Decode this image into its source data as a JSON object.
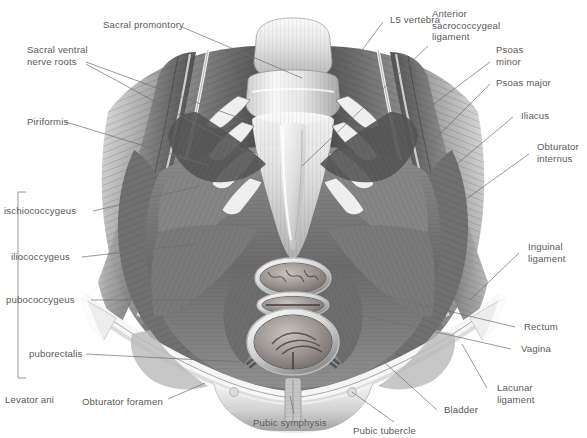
{
  "figure": {
    "background_color": "#ffffff",
    "label_color": "#5a5a5a",
    "leader_color": "#6b6b6b",
    "art_tone_dark": "#4a4a4a",
    "art_tone_mid": "#9a9a9a",
    "art_tone_light": "#dcdcdc"
  },
  "labels": {
    "sacral_promontory": "Sacral promontory",
    "sacral_ventral_nerve_roots": "Sacral ventral\nnerve roots",
    "piriformis": "Piriformis",
    "l5_vertebra": "L5 vertebra",
    "anterior_sacrococcygeal_ligament": "Anterior\nsacrococcygeal\nligament",
    "psoas_minor": "Psoas\nminor",
    "psoas_major": "Psoas major",
    "iliacus": "Iliacus",
    "obturator_internus": "Obturator\ninternus",
    "inguinal_ligament": "Inguinal\nligament",
    "rectum": "Rectum",
    "vagina": "Vagina",
    "lacunar_ligament": "Lacunar\nligament",
    "bladder": "Bladder",
    "pubic_tubercle": "Pubic tubercle",
    "pubic_symphysis": "Pubic symphysis",
    "obturator_foramen": "Obturator foramen",
    "levator_ani": "Levator ani",
    "ischiococcygeus": "ischiococcygeus",
    "iliococcygeus": "iliococcygeus",
    "pubococcygeus": "pubococcygeus",
    "puborectalis": "puborectalis"
  }
}
